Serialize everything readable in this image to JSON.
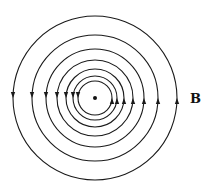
{
  "diagram": {
    "center": {
      "x": 95,
      "y": 98
    },
    "radii": [
      82,
      63,
      49,
      38,
      29,
      22,
      17
    ],
    "line_color": "#1a1a1a",
    "arrow_left_direction": "down",
    "arrow_right_direction": "up",
    "field_label": "B"
  }
}
